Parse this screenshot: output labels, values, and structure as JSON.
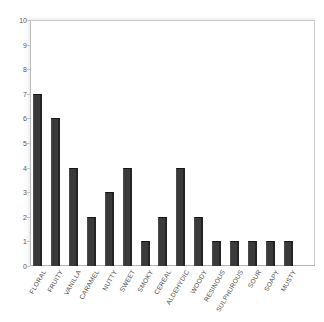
{
  "chart_data": {
    "type": "bar",
    "title": "",
    "subtitle": "",
    "xlabel": "",
    "ylabel": "",
    "ylim": [
      0,
      10
    ],
    "yticks": [
      0,
      1,
      2,
      3,
      4,
      5,
      6,
      7,
      8,
      9,
      10
    ],
    "ytick_labels": [
      "0",
      "1",
      "2",
      "3",
      "4",
      "5",
      "6",
      "7",
      "8",
      "9",
      "10"
    ],
    "grid": false,
    "legend": false,
    "legend_position": "none",
    "bar_color": "#3a3a3a",
    "frame_color": "#c9c9c9",
    "categories": [
      "FLORAL",
      "FRUITY",
      "VANILLA",
      "CARAMEL",
      "NUTTY",
      "SWEET",
      "SMOKY",
      "CEREAL",
      "ALDEHYDIC",
      "WOODY",
      "RESINOUS",
      "SULPHUROUS",
      "SOUR",
      "SOAPY",
      "MUSTY"
    ],
    "values": [
      7,
      6,
      4,
      2,
      3,
      4,
      1,
      2,
      4,
      2,
      1,
      1,
      1,
      1,
      1
    ]
  }
}
